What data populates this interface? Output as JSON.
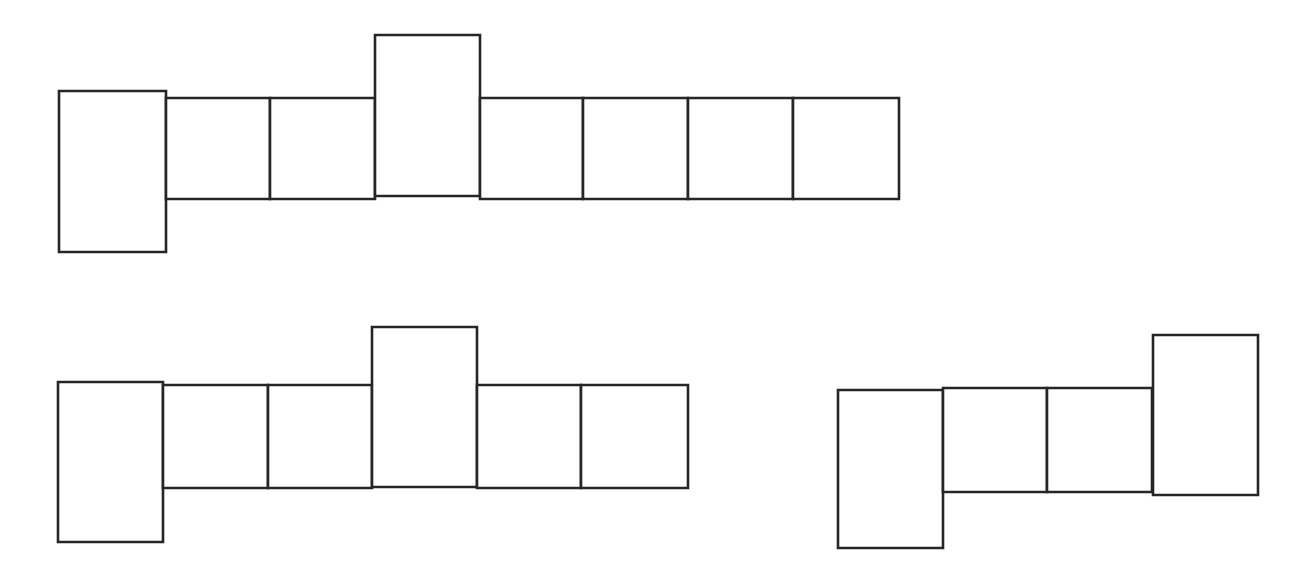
{
  "page": {
    "background_color": "#ffffff",
    "width": 1304,
    "height": 577
  },
  "style": {
    "stroke_color": "#262626",
    "fill_color": "#ffffff",
    "stroke_width": 2.6
  },
  "figures": [
    {
      "id": "figure-1",
      "name": "top-net-eight-cells",
      "label": "Figure 1",
      "cell_count": 8,
      "cells": [
        {
          "name": "cell-1",
          "x": 59,
          "y": 91,
          "w": 107,
          "h": 161,
          "offset": "down"
        },
        {
          "name": "cell-2",
          "x": 166,
          "y": 98,
          "w": 104,
          "h": 101,
          "offset": "none"
        },
        {
          "name": "cell-3",
          "x": 270,
          "y": 98,
          "w": 105,
          "h": 101,
          "offset": "none"
        },
        {
          "name": "cell-4",
          "x": 375,
          "y": 35,
          "w": 105,
          "h": 161,
          "offset": "up"
        },
        {
          "name": "cell-5",
          "x": 480,
          "y": 98,
          "w": 103,
          "h": 101,
          "offset": "none"
        },
        {
          "name": "cell-6",
          "x": 583,
          "y": 98,
          "w": 105,
          "h": 101,
          "offset": "none"
        },
        {
          "name": "cell-7",
          "x": 688,
          "y": 98,
          "w": 105,
          "h": 101,
          "offset": "none"
        },
        {
          "name": "cell-8",
          "x": 793,
          "y": 98,
          "w": 106,
          "h": 101,
          "offset": "none"
        }
      ]
    },
    {
      "id": "figure-2",
      "name": "bottom-left-net-six-cells",
      "label": "Figure 2",
      "cell_count": 6,
      "cells": [
        {
          "name": "cell-1",
          "x": 58,
          "y": 382,
          "w": 105,
          "h": 160,
          "offset": "down"
        },
        {
          "name": "cell-2",
          "x": 163,
          "y": 385,
          "w": 105,
          "h": 103,
          "offset": "none"
        },
        {
          "name": "cell-3",
          "x": 268,
          "y": 385,
          "w": 104,
          "h": 103,
          "offset": "none"
        },
        {
          "name": "cell-4",
          "x": 372,
          "y": 327,
          "w": 105,
          "h": 160,
          "offset": "up"
        },
        {
          "name": "cell-5",
          "x": 477,
          "y": 385,
          "w": 104,
          "h": 103,
          "offset": "none"
        },
        {
          "name": "cell-6",
          "x": 581,
          "y": 385,
          "w": 107,
          "h": 103,
          "offset": "none"
        }
      ]
    },
    {
      "id": "figure-3",
      "name": "bottom-right-net-five-cells",
      "label": "Figure 3",
      "cell_count": 5,
      "cells": [
        {
          "name": "cell-1",
          "x": 838,
          "y": 390,
          "w": 105,
          "h": 158,
          "offset": "down"
        },
        {
          "name": "cell-2",
          "x": 943,
          "y": 388,
          "w": 104,
          "h": 104,
          "offset": "none"
        },
        {
          "name": "cell-3",
          "x": 1047,
          "y": 388,
          "w": 105,
          "h": 104,
          "offset": "none"
        },
        {
          "name": "cell-4",
          "x": 1152,
          "y": 388,
          "w": 0,
          "h": 0,
          "offset": "none"
        },
        {
          "name": "cell-5",
          "x": 1153,
          "y": 335,
          "w": 105,
          "h": 160,
          "offset": "up"
        }
      ]
    }
  ]
}
